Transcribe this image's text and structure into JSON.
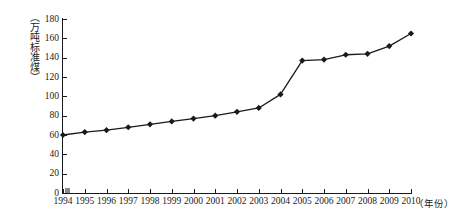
{
  "chart_data": {
    "type": "line",
    "title": "",
    "subtitle": "",
    "xlabel": "（年份）",
    "ylabel": "（万吨标准煤）",
    "categories": [
      "1994",
      "1995",
      "1996",
      "1997",
      "1998",
      "1999",
      "2000",
      "2001",
      "2002",
      "2003",
      "2004",
      "2005",
      "2006",
      "2007",
      "2008",
      "2009",
      "2010"
    ],
    "values": [
      60,
      63,
      65,
      68,
      71,
      74,
      77,
      80,
      84,
      88,
      102,
      137,
      138,
      143,
      144,
      152,
      165
    ],
    "series": [
      {
        "name": "能源消费总量",
        "values": [
          60,
          63,
          65,
          68,
          71,
          74,
          77,
          80,
          84,
          88,
          102,
          137,
          138,
          143,
          144,
          152,
          165
        ]
      }
    ],
    "ylim": [
      0,
      180
    ],
    "y_ticks": [
      0,
      20,
      40,
      60,
      80,
      100,
      120,
      140,
      160,
      180
    ],
    "y_tick_labels": [
      "0",
      "20",
      "40",
      "60",
      "80",
      "100",
      "120",
      "140",
      "160",
      "180"
    ],
    "x_ticks": [
      "1994",
      "1995",
      "1996",
      "1997",
      "1998",
      "1999",
      "2000",
      "2001",
      "2002",
      "2003",
      "2004",
      "2005",
      "2006",
      "2007",
      "2008",
      "2009",
      "2010"
    ],
    "grid": false,
    "legend": false,
    "legend_position": "none",
    "marker": "diamond",
    "line_color": "#1a1a1a",
    "marker_color": "#1a1a1a",
    "background_color": "#ffffff",
    "axis_color": "#1a1a1a",
    "origin_marker_color": "#8a8a8a"
  }
}
